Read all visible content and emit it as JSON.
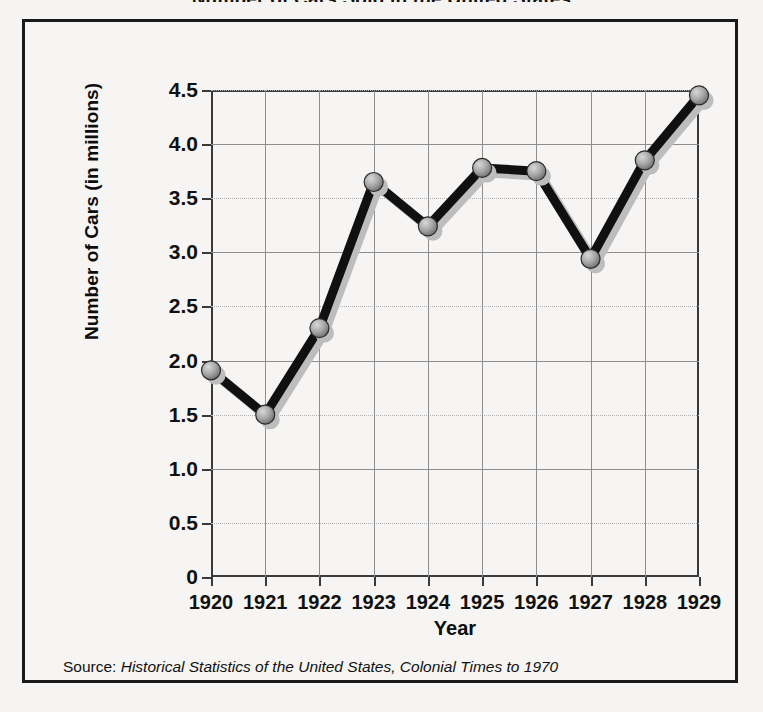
{
  "page": {
    "title_clipped": "Number of Cars Sold in the United States"
  },
  "axes": {
    "y_title": "Number of Cars (in millions)",
    "x_title": "Year",
    "y_ticks": [
      "0",
      "0.5",
      "1.0",
      "1.5",
      "2.0",
      "2.5",
      "3.0",
      "3.5",
      "4.0",
      "4.5"
    ],
    "x_ticks": [
      "1920",
      "1921",
      "1922",
      "1923",
      "1924",
      "1925",
      "1926",
      "1927",
      "1928",
      "1929"
    ]
  },
  "source": {
    "prefix": "Source: ",
    "title": "Historical Statistics of the United States, Colonial Times to 1970"
  },
  "style": {
    "line_color": "#101010",
    "marker_fill": "#9a9a9a",
    "marker_stroke": "#2a2a2a",
    "shadow_color": "#bdbdbd",
    "grid_color": "#8e8e8e",
    "frame_color": "#1a1a1a",
    "background": "#f5f4f2"
  },
  "chart_data": {
    "type": "line",
    "title": "Number of Cars Sold in the United States",
    "xlabel": "Year",
    "ylabel": "Number of Cars (in millions)",
    "x": [
      1920,
      1921,
      1922,
      1923,
      1924,
      1925,
      1926,
      1927,
      1928,
      1929
    ],
    "categories": [
      "1920",
      "1921",
      "1922",
      "1923",
      "1924",
      "1925",
      "1926",
      "1927",
      "1928",
      "1929"
    ],
    "values": [
      1.91,
      1.5,
      2.3,
      3.65,
      3.24,
      3.78,
      3.75,
      2.94,
      3.85,
      4.45
    ],
    "series": [
      {
        "name": "Number of Cars (in millions)",
        "values": [
          1.91,
          1.5,
          2.3,
          3.65,
          3.24,
          3.78,
          3.75,
          2.94,
          3.85,
          4.45
        ]
      }
    ],
    "ylim": [
      0,
      4.5
    ],
    "xlim": [
      1920,
      1929
    ],
    "ytick_values": [
      0,
      0.5,
      1.0,
      1.5,
      2.0,
      2.5,
      3.0,
      3.5,
      4.0,
      4.5
    ],
    "ytick_labels": [
      "0",
      "0.5",
      "1.0",
      "1.5",
      "2.0",
      "2.5",
      "3.0",
      "3.5",
      "4.0",
      "4.5"
    ],
    "grid": true,
    "legend": false,
    "markers": "circle",
    "source_note": "Source: Historical Statistics of the United States, Colonial Times to 1970"
  }
}
